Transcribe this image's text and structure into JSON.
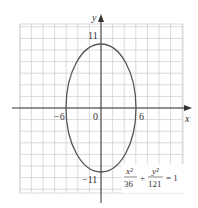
{
  "chart_data": {
    "type": "line",
    "title": "",
    "curve": "ellipse",
    "equation": "x^2/36 + y^2/121 = 1",
    "equation_parts": {
      "term1_num": "x²",
      "term1_den": "36",
      "plus": "+",
      "term2_num": "y²",
      "term2_den": "121",
      "equals": "= 1"
    },
    "semi_axis_x": 6,
    "semi_axis_y": 11,
    "center": [
      0,
      0
    ],
    "xlabel": "x",
    "ylabel": "y",
    "x_tick_labels": [
      "-6",
      "0",
      "6"
    ],
    "y_tick_labels": [
      "11",
      "-11"
    ],
    "grid": true,
    "grid_step": 2,
    "xlim": [
      -14,
      14
    ],
    "ylim": [
      -14.5,
      14.5
    ],
    "colors": {
      "curve": "#555555",
      "grid": "#cccccc",
      "axis": "#333333"
    }
  },
  "labels": {
    "x_axis": "x",
    "y_axis": "y",
    "x_neg": "−6",
    "origin": "0",
    "x_pos": "6",
    "y_pos": "11",
    "y_neg": "−11"
  }
}
